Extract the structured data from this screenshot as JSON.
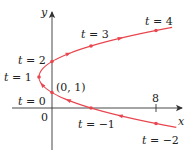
{
  "chart_data": {
    "type": "line",
    "title": "",
    "xlabel": "x",
    "ylabel": "y",
    "curve": "parametric: x = t^2 - 2t, y = t + 1",
    "series": [
      {
        "name": "parametric curve",
        "color": "#e8474f",
        "points": [
          {
            "t": -2,
            "x": 8,
            "y": -1
          },
          {
            "t": -1,
            "x": 3,
            "y": 0
          },
          {
            "t": 0,
            "x": 0,
            "y": 1
          },
          {
            "t": 1,
            "x": -1,
            "y": 2
          },
          {
            "t": 2,
            "x": 0,
            "y": 3
          },
          {
            "t": 3,
            "x": 3,
            "y": 4
          },
          {
            "t": 4,
            "x": 8,
            "y": 5
          }
        ]
      }
    ],
    "x_ticks": [
      8
    ],
    "xlim": [
      -4,
      14
    ],
    "ylim": [
      -3,
      7
    ],
    "grid": false,
    "legend": "none"
  },
  "labels": {
    "y_axis": "y",
    "x_axis": "x",
    "origin": "0",
    "x_tick_8": "8",
    "point_01": "(0, 1)",
    "t_eq": "t =",
    "t_values": {
      "m2": "−2",
      "m1": "−1",
      "z": "0",
      "one": "1",
      "two": "2",
      "three": "3",
      "four": "4"
    }
  },
  "colors": {
    "curve": "#e8474f",
    "axis": "#333333",
    "text": "#222222"
  }
}
